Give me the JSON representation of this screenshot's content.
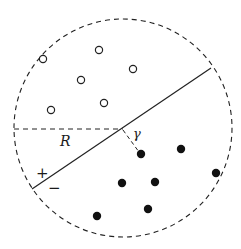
{
  "diagram": {
    "type": "svm-margin-ball",
    "colors": {
      "background": "#ffffff",
      "stroke": "#222222",
      "filled_point": "#111111"
    },
    "ball": {
      "cx": 123,
      "cy": 128,
      "r": 109,
      "style": "dashed"
    },
    "hyperplane": {
      "x1": 32,
      "y1": 189,
      "x2": 211,
      "y2": 68,
      "style": "solid"
    },
    "radius_line": {
      "x1": 14,
      "y1": 129,
      "x2": 123,
      "y2": 129,
      "style": "dashed"
    },
    "margin_line": {
      "x1": 123,
      "y1": 130,
      "x2": 139,
      "y2": 152,
      "style": "dashed"
    },
    "labels": {
      "radius": "R",
      "margin": "γ",
      "positive": "+",
      "negative": "−"
    },
    "positive_points": [
      {
        "x": 43,
        "y": 59
      },
      {
        "x": 99,
        "y": 50
      },
      {
        "x": 133,
        "y": 69
      },
      {
        "x": 81,
        "y": 80
      },
      {
        "x": 104,
        "y": 103
      },
      {
        "x": 51,
        "y": 110
      }
    ],
    "negative_points": [
      {
        "x": 141,
        "y": 154
      },
      {
        "x": 181,
        "y": 149
      },
      {
        "x": 216,
        "y": 173
      },
      {
        "x": 122,
        "y": 183
      },
      {
        "x": 155,
        "y": 182
      },
      {
        "x": 148,
        "y": 209
      },
      {
        "x": 97,
        "y": 216
      }
    ]
  }
}
